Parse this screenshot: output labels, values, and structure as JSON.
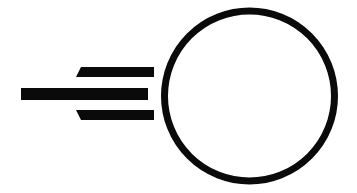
{
  "icon": {
    "name": "moving-ball-icon",
    "description": "Circle with speed lines indicating motion to the right",
    "colors": {
      "stroke": "#0a0a0a",
      "background": "#ffffff"
    },
    "parts": {
      "circle": "circle-outline",
      "speed_lines": [
        "speed-line-top",
        "speed-line-middle",
        "speed-line-bottom"
      ]
    }
  }
}
